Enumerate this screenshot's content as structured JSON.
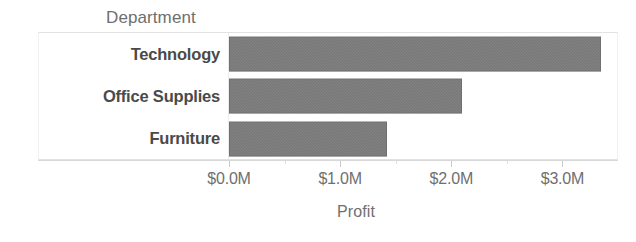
{
  "chart_data": {
    "type": "bar",
    "orientation": "horizontal",
    "title": "",
    "field_header": "Department",
    "categories": [
      "Technology",
      "Office Supplies",
      "Furniture"
    ],
    "values": [
      3.35,
      2.1,
      1.42
    ],
    "value_unit": "M",
    "value_prefix": "$",
    "xlabel": "Profit",
    "ylabel": "Department",
    "xlim": [
      0,
      3.5
    ],
    "xticks": [
      0,
      1,
      2,
      3
    ],
    "xtick_labels": [
      "$0.0M",
      "$1.0M",
      "$2.0M",
      "$3.0M"
    ],
    "grid": false,
    "legend": false,
    "bar_color": "#6d6d6d",
    "axis_text_color": "#6f6f6f",
    "category_text_color": "#4a4a4a",
    "border_color": "#e2e2e2",
    "background": "#ffffff"
  }
}
